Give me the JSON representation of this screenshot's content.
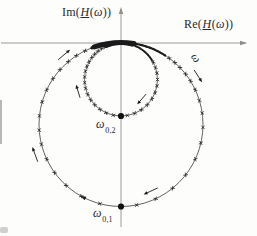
{
  "figure_type": "Nyquist locus (Ortskurve) of a complex transfer function H(ω) with two resonant frequencies",
  "labels": {
    "im_fn": "Im",
    "re_fn": "Re",
    "lp": "(",
    "H": "H",
    "lp2": "(",
    "omega": "ω",
    "rpp": "))",
    "omega_dir": "ω",
    "res2_base": "ω",
    "res2_sub": "0,2",
    "res1_base": "ω",
    "res1_sub": "0,1"
  },
  "colors": {
    "axis": "#8e8e8e",
    "curve": "#3a3a3a",
    "marks": "#1b1b1b",
    "text": "#2a2a2a",
    "background": "#fdfdfc"
  },
  "chart_data": {
    "type": "line",
    "title": "",
    "xlabel": "Re(H(ω))",
    "ylabel": "Im(H(ω))",
    "axis_numeric_ticks": "none (qualitative sketch)",
    "series": [
      {
        "name": "loop-1 (large circle, resonance ω0,1)",
        "shape": "circle",
        "center": {
          "re": 0,
          "im": -1.0
        },
        "radius": 1.0,
        "tangent_to_real_axis_at_origin": true,
        "lowest_point": {
          "re": 0,
          "im": -2.0,
          "label": "ω0,1"
        },
        "traversal": "clockwise with increasing ω"
      },
      {
        "name": "loop-2 (small circle, resonance ω0,2)",
        "shape": "circle",
        "center": {
          "re": 0,
          "im": -0.445
        },
        "radius": 0.445,
        "tangent_to_real_axis_at_origin": true,
        "lowest_point": {
          "re": 0,
          "im": -0.89,
          "label": "ω0,2"
        },
        "traversal": "clockwise with increasing ω"
      }
    ],
    "annotations": [
      "ω direction marker on right side of large loop",
      "ω0,1 dot at bottom of large loop",
      "ω0,2 dot at bottom of small loop"
    ],
    "markers": "equal-frequency-step cross ticks along the curve, accumulating into a dark band at the origin as ω→0 and ω→∞",
    "units": "normalized (large-loop radius = 1)"
  },
  "diagram": {
    "width": 257,
    "height": 236,
    "axes": {
      "h": {
        "x1": 1,
        "x2": 240,
        "y": 43,
        "tipX": 247,
        "headW": 2.2
      },
      "v": {
        "x": 121,
        "y1": 227,
        "y2": 15,
        "tipY": 7,
        "headW": 2.2
      }
    },
    "circles": {
      "large": {
        "cx": 121,
        "cy": 124.5,
        "r": 82
      },
      "small": {
        "cx": 121,
        "cy": 79.5,
        "r": 36.5
      }
    },
    "blobs": [
      {
        "circle": "large",
        "from": 339,
        "to": 353,
        "width": 2.6
      },
      {
        "circle": "large",
        "from": 341,
        "to": 369,
        "width": 5
      },
      {
        "circle": "small",
        "from": 336,
        "to": 378,
        "width": 3.6
      },
      {
        "circle": "large",
        "from": 369,
        "to": 393,
        "width": 2.2,
        "dash": "2.6 1.3"
      },
      {
        "circle": "small",
        "from": 378,
        "to": 418,
        "width": 2.0,
        "dash": "2.2 1.2"
      }
    ],
    "ticks": {
      "large": [
        36,
        41,
        46,
        52,
        58,
        65,
        73,
        82,
        92,
        103,
        115,
        128,
        141,
        155,
        169,
        195,
        209,
        222,
        234,
        245,
        256,
        266,
        276,
        286,
        295,
        304,
        312,
        320,
        327,
        334,
        340,
        346,
        351,
        355
      ],
      "small": [
        62,
        71,
        80,
        90,
        100,
        111,
        122,
        134,
        146,
        158,
        170,
        192,
        204,
        215,
        226,
        236,
        246,
        256,
        265,
        274,
        283,
        291,
        299,
        307,
        314,
        321,
        328,
        334,
        340,
        346,
        351,
        356
      ]
    },
    "tick_arm": 2.3,
    "arrows": [
      {
        "circle": "large",
        "theta": 320,
        "offset": 8,
        "len": 6.5
      },
      {
        "circle": "large",
        "theta": 57,
        "offset": 9,
        "len": 6.0
      },
      {
        "circle": "large",
        "theta": 155,
        "offset": -9,
        "len": 6.5
      },
      {
        "circle": "large",
        "theta": 250,
        "offset": 9,
        "len": 6.5
      },
      {
        "circle": "small",
        "theta": 253,
        "offset": 8,
        "len": 5.5
      },
      {
        "circle": "small",
        "theta": 131,
        "offset": -8,
        "len": 5.5
      }
    ],
    "curve_arrowheads": [
      {
        "circle": "large",
        "theta": 207
      }
    ],
    "dots": [
      {
        "x": 121,
        "y": 116,
        "r": 3.1
      },
      {
        "x": 121,
        "y": 206.5,
        "r": 3.1
      }
    ],
    "omega_label": {
      "x": 193,
      "y": 60,
      "rotate": 55
    }
  }
}
